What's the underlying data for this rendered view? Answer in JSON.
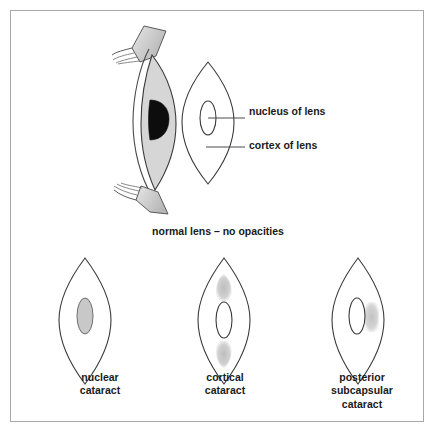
{
  "figure": {
    "border_color": "#a8a8a8",
    "background": "#ffffff"
  },
  "colors": {
    "outline": "#3a3a3a",
    "text": "#1a1a1a",
    "lens_body_fill": "#d6d6d6",
    "nucleus_dark_fill": "#0d0d0d",
    "opacity_fill": "#c9c9c9",
    "nuclear_fill": "#c8c8c8",
    "eyelid_fill": "#cfcfcf",
    "leader_line": "#4a4a4a"
  },
  "slit_lamp_view": {
    "name": "slit-lamp-cross-section",
    "eyelid_upper": "upper-eyelid",
    "eyelid_lower": "lower-eyelid",
    "lens_body": "lens-body",
    "nucleus": "lens-nucleus-dark"
  },
  "anatomy_labels": [
    {
      "id": "nucleus",
      "text": "nucleus of lens",
      "leader_from": "inner oval of lens",
      "leader_to": "label text"
    },
    {
      "id": "cortex",
      "text": "cortex of lens",
      "leader_from": "outer band of lens",
      "leader_to": "label text"
    }
  ],
  "normal_lens": {
    "caption": "normal lens – no opacities",
    "nucleus_filled": false,
    "opacities": []
  },
  "cataract_types": [
    {
      "id": "nuclear",
      "caption": "nuclear\ncataract",
      "caption_lines": [
        "nuclear",
        "cataract"
      ],
      "opacity_location": "central nucleus",
      "nucleus_filled": true,
      "opacity_shapes": [
        "central-nucleus-opacity"
      ]
    },
    {
      "id": "cortical",
      "caption": "cortical\ncataract",
      "caption_lines": [
        "cortical",
        "cataract"
      ],
      "opacity_location": "peripheral cortex, superior and inferior wedges",
      "nucleus_filled": false,
      "opacity_shapes": [
        "superior-cortical-wedge",
        "inferior-cortical-wedge"
      ]
    },
    {
      "id": "posterior-subcapsular",
      "caption": "posterior\nsubcapsular\ncataract",
      "caption_lines": [
        "posterior",
        "subcapsular",
        "cataract"
      ],
      "opacity_location": "posterior capsule, just behind nucleus",
      "nucleus_filled": false,
      "opacity_shapes": [
        "posterior-subcapsular-plaque"
      ]
    }
  ]
}
